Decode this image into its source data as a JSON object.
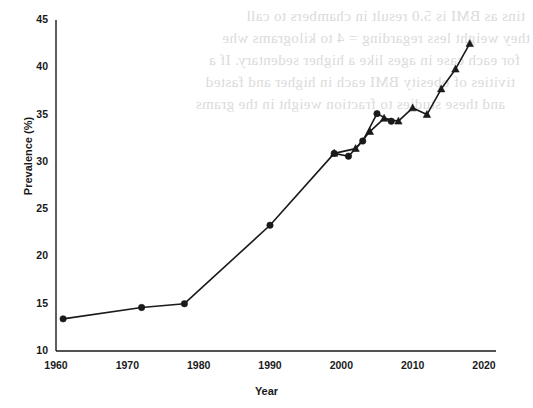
{
  "figure": {
    "background_color": "#ffffff",
    "ink_color": "#1a1a1a",
    "bleed_color": "#cfcfcf",
    "bleed_text_lines": [
      "tins as BMI is 5.0 result in chambers to call",
      "they weight less regarding = 4 to kilograms whe",
      "for each case in ages like a higher sedentary. If a",
      "tivities of obesity BMI each in higher and fasted",
      "and these studies to fraction weight in the grams"
    ]
  },
  "chart_data": {
    "type": "line",
    "title": "",
    "subtitle": "",
    "xlabel": "Year",
    "ylabel": "Prevalence (%)",
    "xlim": [
      1960,
      2020
    ],
    "ylim": [
      10,
      45
    ],
    "xticks": [
      1960,
      1970,
      1980,
      1990,
      2000,
      2010,
      2020
    ],
    "yticks": [
      10,
      15,
      20,
      25,
      30,
      35,
      40,
      45
    ],
    "xtick_labels": [
      "1960",
      "1970",
      "1980",
      "1990",
      "2000",
      "2010",
      "2020"
    ],
    "ytick_labels": [
      "10",
      "15",
      "20",
      "25",
      "30",
      "35",
      "40",
      "45"
    ],
    "grid": false,
    "legend": null,
    "legend_position": "none",
    "line_color": "#1a1a1a",
    "marker_color": "#1a1a1a",
    "series": [
      {
        "name": "series-circle-markers",
        "marker": "circle",
        "x": [
          1961,
          1972,
          1978,
          1990,
          1999,
          2001,
          2003,
          2005,
          2007
        ],
        "values": [
          13.4,
          14.6,
          15.0,
          23.3,
          30.9,
          30.6,
          32.2,
          35.1,
          34.3
        ]
      },
      {
        "name": "series-triangle-markers",
        "marker": "triangle",
        "x": [
          1999,
          2002,
          2004,
          2006,
          2008,
          2010,
          2012,
          2014,
          2016,
          2018
        ],
        "values": [
          30.9,
          31.4,
          33.2,
          34.6,
          34.3,
          35.7,
          35.0,
          37.7,
          39.8,
          42.5
        ]
      }
    ]
  }
}
